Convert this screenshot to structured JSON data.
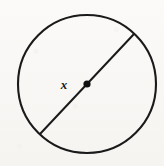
{
  "figure": {
    "kind": "geometry-diagram",
    "background_color": "#f8f7f5",
    "ink_color": "#1a1a1a",
    "canvas": {
      "width": 164,
      "height": 166
    },
    "circle": {
      "name": "circle-outline",
      "center_x": 87,
      "center_y": 84,
      "radius": 69,
      "stroke_width": 2.1,
      "stroke_color": "#1a1a1a"
    },
    "diameter": {
      "name": "diameter-segment",
      "x1": 40,
      "y1": 134,
      "x2": 134,
      "y2": 34,
      "stroke_width": 2.0,
      "stroke_color": "#1a1a1a"
    },
    "center_point": {
      "name": "center-dot",
      "cx": 87,
      "cy": 84,
      "radius": 3.6,
      "fill_color": "#111111"
    },
    "labels": [
      {
        "name": "radius-label-x",
        "text": "x",
        "x": 64,
        "y": 86,
        "font_size": 13,
        "style": "bold-italic",
        "color": "#1a1a1a"
      }
    ]
  }
}
